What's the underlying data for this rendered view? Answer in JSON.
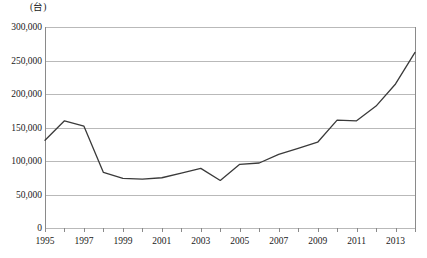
{
  "chart_data": {
    "type": "line",
    "title": "",
    "xlabel": "",
    "ylabel": "(台)",
    "unit_label": "(台)",
    "x": [
      1995,
      1996,
      1997,
      1998,
      1999,
      2000,
      2001,
      2002,
      2003,
      2004,
      2005,
      2006,
      2007,
      2008,
      2009,
      2010,
      2011,
      2012,
      2013,
      2014
    ],
    "values": [
      131000,
      160000,
      152000,
      83000,
      74000,
      73000,
      75000,
      82000,
      89000,
      71000,
      95000,
      97000,
      110000,
      119000,
      128000,
      161000,
      160000,
      182000,
      215000,
      262000
    ],
    "series": [
      {
        "name": "",
        "values": [
          131000,
          160000,
          152000,
          83000,
          74000,
          73000,
          75000,
          82000,
          89000,
          71000,
          95000,
          97000,
          110000,
          119000,
          128000,
          161000,
          160000,
          182000,
          215000,
          262000
        ]
      }
    ],
    "ylim": [
      0,
      300000
    ],
    "xlim": [
      1995,
      2014
    ],
    "ytick_values": [
      0,
      50000,
      100000,
      150000,
      200000,
      250000,
      300000
    ],
    "ytick_labels": [
      "0",
      "50,000",
      "100,000",
      "150,000",
      "200,000",
      "250,000",
      "300,000"
    ],
    "xtick_values": [
      1995,
      1996,
      1997,
      1998,
      1999,
      2000,
      2001,
      2002,
      2003,
      2004,
      2005,
      2006,
      2007,
      2008,
      2009,
      2010,
      2011,
      2012,
      2013,
      2014
    ],
    "xtick_labels_shown": [
      {
        "year": 1995,
        "label": "1995"
      },
      {
        "year": 1997,
        "label": "1997"
      },
      {
        "year": 1999,
        "label": "1999"
      },
      {
        "year": 2001,
        "label": "2001"
      },
      {
        "year": 2003,
        "label": "2003"
      },
      {
        "year": 2005,
        "label": "2005"
      },
      {
        "year": 2007,
        "label": "2007"
      },
      {
        "year": 2009,
        "label": "2009"
      },
      {
        "year": 2011,
        "label": "2011"
      },
      {
        "year": 2013,
        "label": "2013"
      }
    ],
    "grid": true,
    "grid_axis": "y",
    "legend": false,
    "legend_position": "none",
    "line_color": "#3a3a3a",
    "grid_color": "#b9b9b9",
    "axis_color": "#8a8a8a",
    "background_color": "#ffffff"
  }
}
